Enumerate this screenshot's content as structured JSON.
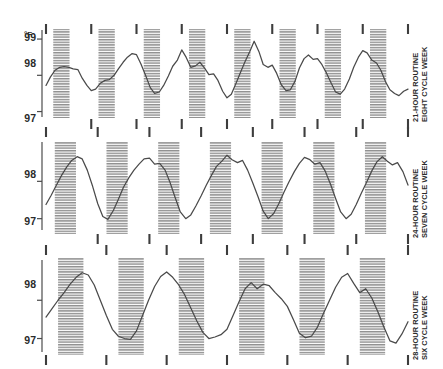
{
  "figure": {
    "unit_label": "°F",
    "background": "#ffffff",
    "trace_color": "#4a4a4a",
    "band_color": "#9a9a9a"
  },
  "chart_data": {
    "type": "line",
    "title": "",
    "xlabel": "",
    "ylabel": "°F",
    "ylim": [
      96.85,
      99.25
    ],
    "grid": false,
    "legend": "none",
    "panels": [
      {
        "id": "panel-21h",
        "label_line1": "21-HOUR ROUTINE",
        "label_line2": "EIGHT CYCLE WEEK",
        "routine_hours": 21,
        "cycles": 8,
        "ytick_values": [
          99,
          98,
          97
        ],
        "ytick_labels": [
          "99",
          "98",
          "97"
        ],
        "ylim": [
          96.85,
          99.25
        ],
        "period_fraction": 0.125,
        "sleep_band_start_fraction": 0.16,
        "sleep_band_end_fraction": 0.52,
        "top_ticks": [
          0.0,
          0.125,
          0.25,
          0.375,
          0.5,
          0.625,
          0.75,
          0.875,
          1.0
        ],
        "bottom_ticks": [
          0.125,
          0.25,
          0.375,
          0.5,
          0.625,
          0.75,
          0.875,
          1.0
        ],
        "series_name": "body temperature",
        "x": [
          0.0,
          0.012,
          0.025,
          0.038,
          0.05,
          0.063,
          0.075,
          0.088,
          0.1,
          0.113,
          0.125,
          0.137,
          0.15,
          0.163,
          0.175,
          0.188,
          0.2,
          0.213,
          0.225,
          0.238,
          0.25,
          0.262,
          0.275,
          0.288,
          0.3,
          0.313,
          0.325,
          0.338,
          0.35,
          0.363,
          0.375,
          0.387,
          0.4,
          0.413,
          0.425,
          0.438,
          0.45,
          0.463,
          0.475,
          0.488,
          0.5,
          0.512,
          0.525,
          0.538,
          0.55,
          0.563,
          0.575,
          0.588,
          0.6,
          0.613,
          0.625,
          0.637,
          0.65,
          0.663,
          0.675,
          0.688,
          0.7,
          0.713,
          0.725,
          0.738,
          0.75,
          0.762,
          0.775,
          0.788,
          0.8,
          0.813,
          0.825,
          0.838,
          0.85,
          0.863,
          0.875,
          0.887,
          0.9,
          0.913,
          0.925,
          0.938,
          0.95,
          0.963,
          0.975,
          0.988,
          1.0
        ],
        "y": [
          97.72,
          97.95,
          98.14,
          98.22,
          98.24,
          98.22,
          98.18,
          98.16,
          97.92,
          97.72,
          97.58,
          97.62,
          97.78,
          97.86,
          97.88,
          98.0,
          98.18,
          98.36,
          98.5,
          98.6,
          98.57,
          98.32,
          98.0,
          97.66,
          97.5,
          97.54,
          97.72,
          97.98,
          98.25,
          98.42,
          98.7,
          98.5,
          98.22,
          98.26,
          98.36,
          98.2,
          98.02,
          98.04,
          97.86,
          97.56,
          97.38,
          97.48,
          97.78,
          98.1,
          98.38,
          98.66,
          98.94,
          98.66,
          98.3,
          98.22,
          98.28,
          98.06,
          97.74,
          97.58,
          97.6,
          97.84,
          98.2,
          98.46,
          98.56,
          98.44,
          98.46,
          98.3,
          98.06,
          97.78,
          97.54,
          97.48,
          97.62,
          97.9,
          98.22,
          98.5,
          98.68,
          98.62,
          98.42,
          98.34,
          98.14,
          97.82,
          97.6,
          97.5,
          97.44,
          97.56,
          97.62
        ],
        "annotations": []
      },
      {
        "id": "panel-24h",
        "label_line1": "24-HOUR ROUTINE",
        "label_line2": "SEVEN CYCLE WEEK",
        "routine_hours": 24,
        "cycles": 7,
        "ytick_values": [
          98,
          97
        ],
        "ytick_labels": [
          "98",
          "97"
        ],
        "ylim": [
          96.75,
          99.0
        ],
        "period_fraction": 0.1428,
        "sleep_band_start_fraction": 0.17,
        "sleep_band_end_fraction": 0.58,
        "top_ticks": [
          0.0,
          0.1428,
          0.2857,
          0.4285,
          0.5714,
          0.7142,
          0.857,
          1.0
        ],
        "bottom_ticks": [
          0.1428,
          0.2857,
          0.4285,
          0.5714,
          0.7142,
          0.857,
          1.0
        ],
        "series_name": "body temperature",
        "x": [
          0.0,
          0.014,
          0.029,
          0.043,
          0.057,
          0.071,
          0.086,
          0.1,
          0.114,
          0.129,
          0.143,
          0.157,
          0.171,
          0.186,
          0.2,
          0.214,
          0.229,
          0.243,
          0.257,
          0.271,
          0.286,
          0.3,
          0.314,
          0.329,
          0.343,
          0.357,
          0.371,
          0.386,
          0.4,
          0.414,
          0.429,
          0.443,
          0.457,
          0.471,
          0.486,
          0.5,
          0.514,
          0.529,
          0.543,
          0.557,
          0.571,
          0.586,
          0.6,
          0.614,
          0.629,
          0.643,
          0.657,
          0.671,
          0.686,
          0.7,
          0.714,
          0.729,
          0.743,
          0.757,
          0.771,
          0.786,
          0.8,
          0.814,
          0.829,
          0.843,
          0.857,
          0.871,
          0.886,
          0.9,
          0.914,
          0.929,
          0.943,
          0.957,
          0.971,
          0.986,
          1.0
        ],
        "y": [
          97.38,
          97.62,
          97.9,
          98.16,
          98.38,
          98.56,
          98.66,
          98.6,
          98.3,
          97.86,
          97.4,
          97.06,
          96.98,
          97.22,
          97.52,
          97.84,
          98.1,
          98.3,
          98.46,
          98.6,
          98.62,
          98.46,
          98.48,
          98.3,
          97.96,
          97.56,
          97.18,
          97.0,
          97.1,
          97.34,
          97.62,
          97.9,
          98.16,
          98.4,
          98.54,
          98.7,
          98.58,
          98.5,
          98.56,
          98.3,
          97.96,
          97.58,
          97.2,
          97.0,
          97.14,
          97.4,
          97.7,
          97.98,
          98.26,
          98.48,
          98.64,
          98.58,
          98.46,
          98.5,
          98.28,
          97.92,
          97.54,
          97.18,
          97.0,
          97.12,
          97.38,
          97.68,
          97.98,
          98.28,
          98.52,
          98.66,
          98.54,
          98.44,
          98.5,
          98.26,
          97.9
        ],
        "annotations": []
      },
      {
        "id": "panel-28h",
        "label_line1": "28-HOUR ROUTINE",
        "label_line2": "SIX CYCLE WEEK",
        "routine_hours": 28,
        "cycles": 6,
        "ytick_values": [
          98,
          97
        ],
        "ytick_labels": [
          "98",
          "97"
        ],
        "ylim": [
          96.7,
          99.0
        ],
        "period_fraction": 0.1667,
        "sleep_band_start_fraction": 0.2,
        "sleep_band_end_fraction": 0.62,
        "top_ticks": [
          0.0,
          0.1667,
          0.3333,
          0.5,
          0.6667,
          0.8333,
          1.0
        ],
        "bottom_ticks": [
          0.0,
          0.1667,
          0.3333,
          0.5,
          0.6667,
          0.8333,
          1.0
        ],
        "series_name": "body temperature",
        "x": [
          0.0,
          0.0167,
          0.0333,
          0.05,
          0.0667,
          0.0833,
          0.1,
          0.1167,
          0.1333,
          0.15,
          0.1667,
          0.1833,
          0.2,
          0.2167,
          0.2333,
          0.25,
          0.2667,
          0.2833,
          0.3,
          0.3167,
          0.3333,
          0.35,
          0.3667,
          0.3833,
          0.4,
          0.4167,
          0.4333,
          0.45,
          0.4667,
          0.4833,
          0.5,
          0.5167,
          0.5333,
          0.55,
          0.5667,
          0.5833,
          0.6,
          0.6167,
          0.6333,
          0.65,
          0.6667,
          0.6833,
          0.7,
          0.7167,
          0.7333,
          0.75,
          0.7667,
          0.7833,
          0.8,
          0.8167,
          0.8333,
          0.85,
          0.8667,
          0.8833,
          0.9,
          0.9167,
          0.9333,
          0.95,
          0.9667,
          0.9833,
          1.0
        ],
        "y": [
          97.56,
          97.78,
          98.0,
          98.2,
          98.42,
          98.6,
          98.72,
          98.66,
          98.4,
          98.0,
          97.6,
          97.24,
          97.06,
          97.0,
          96.98,
          97.2,
          97.6,
          98.0,
          98.36,
          98.62,
          98.74,
          98.6,
          98.4,
          98.14,
          97.8,
          97.46,
          97.16,
          97.0,
          97.04,
          97.1,
          97.24,
          97.6,
          97.96,
          98.3,
          98.46,
          98.3,
          98.42,
          98.38,
          98.2,
          98.04,
          97.84,
          97.5,
          97.14,
          97.02,
          97.06,
          97.3,
          97.66,
          98.0,
          98.34,
          98.6,
          98.7,
          98.44,
          98.2,
          98.3,
          98.06,
          97.7,
          97.3,
          96.94,
          96.88,
          97.12,
          97.44
        ],
        "annotations": []
      }
    ]
  }
}
